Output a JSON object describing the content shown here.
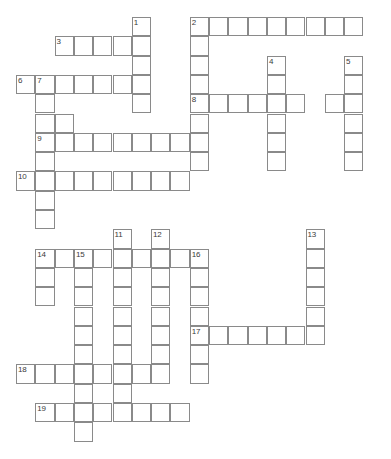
{
  "puzzle": {
    "title": "Crossword Grid",
    "grid": {
      "cell_size": 19.3,
      "origin_x": 16,
      "origin_y": 17,
      "columns": 20,
      "rows": 23,
      "cell_border_color": "#8a8a8a",
      "cell_fill_color": "#ffffff",
      "number_color": "#3a3a3a",
      "background_color": "#ffffff"
    },
    "entries": [
      {
        "number": 1,
        "direction": "down",
        "col": 6,
        "row": 0,
        "length": 5
      },
      {
        "number": 2,
        "direction": "across",
        "col": 9,
        "row": 0,
        "length": 9
      },
      {
        "number": 2,
        "direction": "down",
        "col": 9,
        "row": 0,
        "length": 8
      },
      {
        "number": 3,
        "direction": "across",
        "col": 2,
        "row": 1,
        "length": 5
      },
      {
        "number": 4,
        "direction": "down",
        "col": 13,
        "row": 2,
        "length": 6
      },
      {
        "number": 5,
        "direction": "down",
        "col": 17,
        "row": 2,
        "length": 6
      },
      {
        "number": 6,
        "direction": "across",
        "col": 0,
        "row": 3,
        "length": 7
      },
      {
        "number": 7,
        "direction": "down",
        "col": 1,
        "row": 3,
        "length": 7
      },
      {
        "number": 8,
        "direction": "across",
        "col": 9,
        "row": 4,
        "length": 6
      },
      {
        "number": 9,
        "across_note": "row 6",
        "direction": "across",
        "col": 1,
        "row": 6,
        "length": 8
      },
      {
        "number": 10,
        "direction": "across",
        "col": 0,
        "row": 8,
        "length": 9
      },
      {
        "number": 11,
        "direction": "down",
        "col": 5,
        "row": 11,
        "length": 8
      },
      {
        "number": 12,
        "direction": "down",
        "col": 7,
        "row": 11,
        "length": 8
      },
      {
        "number": 13,
        "direction": "down",
        "col": 15,
        "row": 11,
        "length": 7
      },
      {
        "number": 14,
        "direction": "across",
        "col": 1,
        "row": 12,
        "length": 9
      },
      {
        "number": 14,
        "direction": "down",
        "col": 1,
        "row": 12,
        "length": 3
      },
      {
        "number": 15,
        "direction": "down",
        "col": 3,
        "row": 12,
        "length": 9
      },
      {
        "number": 16,
        "direction": "down",
        "col": 9,
        "row": 12,
        "length": 6
      },
      {
        "number": 17,
        "direction": "across",
        "col": 9,
        "row": 16,
        "length": 7
      },
      {
        "number": 18,
        "direction": "across",
        "col": 0,
        "row": 18,
        "length": 7
      },
      {
        "number": 19,
        "direction": "across",
        "col": 1,
        "row": 20,
        "length": 8
      }
    ],
    "cells": [
      {
        "col": 6,
        "row": 0,
        "number": "1"
      },
      {
        "col": 9,
        "row": 0,
        "number": "2"
      },
      {
        "col": 10,
        "row": 0,
        "number": ""
      },
      {
        "col": 11,
        "row": 0,
        "number": ""
      },
      {
        "col": 12,
        "row": 0,
        "number": ""
      },
      {
        "col": 13,
        "row": 0,
        "number": ""
      },
      {
        "col": 14,
        "row": 0,
        "number": ""
      },
      {
        "col": 15,
        "row": 0,
        "number": ""
      },
      {
        "col": 16,
        "row": 0,
        "number": ""
      },
      {
        "col": 17,
        "row": 0,
        "number": ""
      },
      {
        "col": 2,
        "row": 1,
        "number": "3"
      },
      {
        "col": 3,
        "row": 1,
        "number": ""
      },
      {
        "col": 4,
        "row": 1,
        "number": ""
      },
      {
        "col": 5,
        "row": 1,
        "number": ""
      },
      {
        "col": 6,
        "row": 1,
        "number": ""
      },
      {
        "col": 9,
        "row": 1,
        "number": ""
      },
      {
        "col": 6,
        "row": 2,
        "number": ""
      },
      {
        "col": 9,
        "row": 2,
        "number": ""
      },
      {
        "col": 13,
        "row": 2,
        "number": "4"
      },
      {
        "col": 17,
        "row": 2,
        "number": "5"
      },
      {
        "col": 0,
        "row": 3,
        "number": "6"
      },
      {
        "col": 1,
        "row": 3,
        "number": "7"
      },
      {
        "col": 2,
        "row": 3,
        "number": ""
      },
      {
        "col": 3,
        "row": 3,
        "number": ""
      },
      {
        "col": 4,
        "row": 3,
        "number": ""
      },
      {
        "col": 5,
        "row": 3,
        "number": ""
      },
      {
        "col": 6,
        "row": 3,
        "number": ""
      },
      {
        "col": 9,
        "row": 3,
        "number": ""
      },
      {
        "col": 13,
        "row": 3,
        "number": ""
      },
      {
        "col": 17,
        "row": 3,
        "number": ""
      },
      {
        "col": 1,
        "row": 4,
        "number": ""
      },
      {
        "col": 6,
        "row": 4,
        "number": ""
      },
      {
        "col": 9,
        "row": 4,
        "number": "8"
      },
      {
        "col": 10,
        "row": 4,
        "number": ""
      },
      {
        "col": 11,
        "row": 4,
        "number": ""
      },
      {
        "col": 12,
        "row": 4,
        "number": ""
      },
      {
        "col": 13,
        "row": 4,
        "number": ""
      },
      {
        "col": 14,
        "row": 4,
        "number": ""
      },
      {
        "col": 16,
        "row": 4,
        "number": ""
      },
      {
        "col": 17,
        "row": 4,
        "number": ""
      },
      {
        "col": 1,
        "row": 5,
        "number": ""
      },
      {
        "col": 2,
        "row": 5,
        "number": ""
      },
      {
        "col": 9,
        "row": 5,
        "number": ""
      },
      {
        "col": 13,
        "row": 5,
        "number": ""
      },
      {
        "col": 17,
        "row": 5,
        "number": ""
      },
      {
        "col": 1,
        "row": 6,
        "number": "9"
      },
      {
        "col": 2,
        "row": 6,
        "number": ""
      },
      {
        "col": 3,
        "row": 6,
        "number": ""
      },
      {
        "col": 4,
        "row": 6,
        "number": ""
      },
      {
        "col": 5,
        "row": 6,
        "number": ""
      },
      {
        "col": 6,
        "row": 6,
        "number": ""
      },
      {
        "col": 7,
        "row": 6,
        "number": ""
      },
      {
        "col": 8,
        "row": 6,
        "number": ""
      },
      {
        "col": 9,
        "row": 6,
        "number": ""
      },
      {
        "col": 13,
        "row": 6,
        "number": ""
      },
      {
        "col": 17,
        "row": 6,
        "number": ""
      },
      {
        "col": 1,
        "row": 7,
        "number": ""
      },
      {
        "col": 9,
        "row": 7,
        "number": ""
      },
      {
        "col": 13,
        "row": 7,
        "number": ""
      },
      {
        "col": 17,
        "row": 7,
        "number": ""
      },
      {
        "col": 0,
        "row": 8,
        "number": "10"
      },
      {
        "col": 1,
        "row": 8,
        "number": ""
      },
      {
        "col": 2,
        "row": 8,
        "number": ""
      },
      {
        "col": 3,
        "row": 8,
        "number": ""
      },
      {
        "col": 4,
        "row": 8,
        "number": ""
      },
      {
        "col": 5,
        "row": 8,
        "number": ""
      },
      {
        "col": 6,
        "row": 8,
        "number": ""
      },
      {
        "col": 7,
        "row": 8,
        "number": ""
      },
      {
        "col": 8,
        "row": 8,
        "number": ""
      },
      {
        "col": 1,
        "row": 9,
        "number": ""
      },
      {
        "col": 1,
        "row": 10,
        "number": ""
      },
      {
        "col": 5,
        "row": 11,
        "number": "11"
      },
      {
        "col": 7,
        "row": 11,
        "number": "12"
      },
      {
        "col": 15,
        "row": 11,
        "number": "13"
      },
      {
        "col": 1,
        "row": 12,
        "number": "14"
      },
      {
        "col": 2,
        "row": 12,
        "number": ""
      },
      {
        "col": 3,
        "row": 12,
        "number": "15"
      },
      {
        "col": 4,
        "row": 12,
        "number": ""
      },
      {
        "col": 5,
        "row": 12,
        "number": ""
      },
      {
        "col": 6,
        "row": 12,
        "number": ""
      },
      {
        "col": 7,
        "row": 12,
        "number": ""
      },
      {
        "col": 8,
        "row": 12,
        "number": ""
      },
      {
        "col": 9,
        "row": 12,
        "number": "16"
      },
      {
        "col": 15,
        "row": 12,
        "number": ""
      },
      {
        "col": 1,
        "row": 13,
        "number": ""
      },
      {
        "col": 3,
        "row": 13,
        "number": ""
      },
      {
        "col": 5,
        "row": 13,
        "number": ""
      },
      {
        "col": 7,
        "row": 13,
        "number": ""
      },
      {
        "col": 9,
        "row": 13,
        "number": ""
      },
      {
        "col": 15,
        "row": 13,
        "number": ""
      },
      {
        "col": 1,
        "row": 14,
        "number": ""
      },
      {
        "col": 3,
        "row": 14,
        "number": ""
      },
      {
        "col": 5,
        "row": 14,
        "number": ""
      },
      {
        "col": 7,
        "row": 14,
        "number": ""
      },
      {
        "col": 9,
        "row": 14,
        "number": ""
      },
      {
        "col": 15,
        "row": 14,
        "number": ""
      },
      {
        "col": 3,
        "row": 15,
        "number": ""
      },
      {
        "col": 5,
        "row": 15,
        "number": ""
      },
      {
        "col": 7,
        "row": 15,
        "number": ""
      },
      {
        "col": 9,
        "row": 15,
        "number": ""
      },
      {
        "col": 15,
        "row": 15,
        "number": ""
      },
      {
        "col": 3,
        "row": 16,
        "number": ""
      },
      {
        "col": 5,
        "row": 16,
        "number": ""
      },
      {
        "col": 7,
        "row": 16,
        "number": ""
      },
      {
        "col": 9,
        "row": 16,
        "number": "17"
      },
      {
        "col": 10,
        "row": 16,
        "number": ""
      },
      {
        "col": 11,
        "row": 16,
        "number": ""
      },
      {
        "col": 12,
        "row": 16,
        "number": ""
      },
      {
        "col": 13,
        "row": 16,
        "number": ""
      },
      {
        "col": 14,
        "row": 16,
        "number": ""
      },
      {
        "col": 15,
        "row": 16,
        "number": ""
      },
      {
        "col": 3,
        "row": 17,
        "number": ""
      },
      {
        "col": 5,
        "row": 17,
        "number": ""
      },
      {
        "col": 7,
        "row": 17,
        "number": ""
      },
      {
        "col": 9,
        "row": 17,
        "number": ""
      },
      {
        "col": 0,
        "row": 18,
        "number": "18"
      },
      {
        "col": 1,
        "row": 18,
        "number": ""
      },
      {
        "col": 2,
        "row": 18,
        "number": ""
      },
      {
        "col": 3,
        "row": 18,
        "number": ""
      },
      {
        "col": 4,
        "row": 18,
        "number": ""
      },
      {
        "col": 5,
        "row": 18,
        "number": ""
      },
      {
        "col": 6,
        "row": 18,
        "number": ""
      },
      {
        "col": 7,
        "row": 18,
        "number": ""
      },
      {
        "col": 9,
        "row": 18,
        "number": ""
      },
      {
        "col": 3,
        "row": 19,
        "number": ""
      },
      {
        "col": 5,
        "row": 19,
        "number": ""
      },
      {
        "col": 1,
        "row": 20,
        "number": "19"
      },
      {
        "col": 2,
        "row": 20,
        "number": ""
      },
      {
        "col": 3,
        "row": 20,
        "number": ""
      },
      {
        "col": 4,
        "row": 20,
        "number": ""
      },
      {
        "col": 5,
        "row": 20,
        "number": ""
      },
      {
        "col": 6,
        "row": 20,
        "number": ""
      },
      {
        "col": 7,
        "row": 20,
        "number": ""
      },
      {
        "col": 8,
        "row": 20,
        "number": ""
      },
      {
        "col": 3,
        "row": 21,
        "number": ""
      }
    ]
  }
}
